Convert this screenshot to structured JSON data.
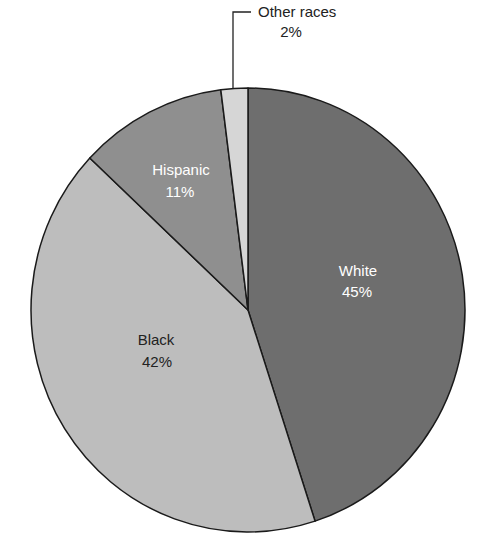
{
  "chart_data": {
    "type": "pie",
    "title": "",
    "categories": [
      "White",
      "Black",
      "Hispanic",
      "Other races"
    ],
    "values": [
      45,
      42,
      11,
      2
    ],
    "labels": [
      "45%",
      "42%",
      "11%",
      "2%"
    ],
    "colors": [
      "#6e6e6e",
      "#bdbdbd",
      "#8f8f8f",
      "#d6d6d6"
    ],
    "legend": "none",
    "start_angle_deg_clockwise_from_top": 0,
    "annotations": [
      {
        "text": "Other races 2%",
        "type": "leader-line callout"
      }
    ]
  },
  "slices": [
    {
      "name": "White",
      "pct": "45%",
      "color": "#6e6e6e",
      "text_color": "#ffffff"
    },
    {
      "name": "Black",
      "pct": "42%",
      "color": "#bdbdbd",
      "text_color": "#222222"
    },
    {
      "name": "Hispanic",
      "pct": "11%",
      "color": "#8f8f8f",
      "text_color": "#ffffff"
    },
    {
      "name": "Other races",
      "pct": "2%",
      "color": "#d6d6d6",
      "text_color": "#222222"
    }
  ]
}
